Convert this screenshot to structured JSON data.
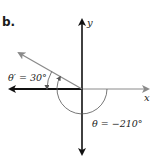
{
  "figure": {
    "part_label": "b.",
    "axes": {
      "x_label": "x",
      "y_label": "y"
    },
    "reference_angle_label": "θ′ = 30°",
    "angle_label": "θ = −210°",
    "angle_degrees": -210,
    "reference_angle_degrees": 30,
    "colors": {
      "axis": "#111111",
      "ray": "#8a8a8a",
      "arc": "#555555",
      "text": "#222222"
    }
  }
}
